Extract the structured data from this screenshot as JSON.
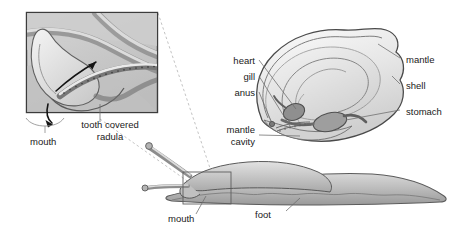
{
  "figure": {
    "colors": {
      "outline": "#4a4a4a",
      "label_text": "#1a1a1a",
      "leader_line": "#6b6b6b",
      "shell_light": "#f0f0f0",
      "shell_mid": "#dcdcdc",
      "body_grey": "#c4c4c4",
      "body_dark": "#8f8f8f",
      "inset_border": "#3c3c3c",
      "dashed_guide": "#a9a9a9"
    }
  },
  "inset": {
    "name": "magnified-mouth-radula-inset",
    "box": {
      "x": 26,
      "y": 12,
      "width": 132,
      "height": 101
    },
    "labels": {
      "radula": "tooth covered\nradula",
      "radula_line1": "tooth covered",
      "radula_line2": "radula",
      "mouth": "mouth"
    }
  },
  "main": {
    "name": "whole-snail-illustration",
    "labels": {
      "heart": "heart",
      "gill": "gill",
      "anus": "anus",
      "mantle_cavity_line1": "mantle",
      "mantle_cavity_line2": "cavity",
      "mantle": "mantle",
      "shell": "shell",
      "stomach": "stomach",
      "mouth": "mouth",
      "foot": "foot"
    }
  },
  "callouts": [
    {
      "label": "heart",
      "side": "left",
      "x": 255,
      "y": 62
    },
    {
      "label": "gill",
      "side": "left",
      "x": 255,
      "y": 78
    },
    {
      "label": "anus",
      "side": "left",
      "x": 255,
      "y": 94
    },
    {
      "label": "mantle cavity",
      "side": "left",
      "x": 255,
      "y": 136
    },
    {
      "label": "mantle",
      "side": "right",
      "x": 404,
      "y": 60
    },
    {
      "label": "shell",
      "side": "right",
      "x": 404,
      "y": 86
    },
    {
      "label": "stomach",
      "side": "right",
      "x": 404,
      "y": 113
    },
    {
      "label": "mouth",
      "side": "bottom",
      "x": 175,
      "y": 218
    },
    {
      "label": "foot",
      "side": "bottom",
      "x": 262,
      "y": 215
    },
    {
      "label": "tooth covered radula",
      "side": "inset",
      "x": 80,
      "y": 125
    },
    {
      "label": "mouth",
      "side": "inset",
      "x": 45,
      "y": 141
    }
  ]
}
